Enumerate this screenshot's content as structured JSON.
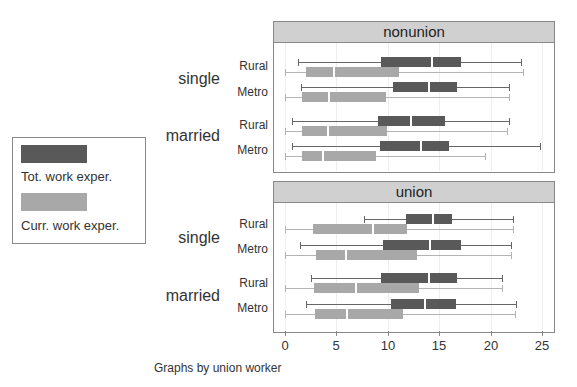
{
  "chart_data": {
    "type": "boxplot",
    "orientation": "horizontal",
    "title": "",
    "note": "Graphs by union worker",
    "xlabel": "",
    "xlim": [
      0,
      25
    ],
    "xticks": [
      0,
      5,
      10,
      15,
      20,
      25
    ],
    "grid": true,
    "legend": {
      "position": "left",
      "entries": [
        {
          "label": "Tot. work exper.",
          "color": "#595959"
        },
        {
          "label": "Curr. work exper.",
          "color": "#a8a8a8"
        }
      ]
    },
    "panels": [
      {
        "title": "nonunion",
        "groups": [
          {
            "label": "single",
            "rows": [
              {
                "label": "Rural",
                "tot": {
                  "min": 1.3,
                  "q1": 9.3,
                  "median": 14.3,
                  "q3": 17.1,
                  "max": 23.0
                },
                "curr": {
                  "min": 0.0,
                  "q1": 2.0,
                  "median": 4.8,
                  "q3": 11.1,
                  "max": 23.2
                }
              },
              {
                "label": "Metro",
                "tot": {
                  "min": 1.6,
                  "q1": 10.5,
                  "median": 14.0,
                  "q3": 16.7,
                  "max": 21.8
                },
                "curr": {
                  "min": 0.0,
                  "q1": 1.7,
                  "median": 4.3,
                  "q3": 9.8,
                  "max": 21.8
                }
              }
            ]
          },
          {
            "label": "married",
            "rows": [
              {
                "label": "Rural",
                "tot": {
                  "min": 0.7,
                  "q1": 9.0,
                  "median": 12.3,
                  "q3": 15.6,
                  "max": 21.8
                },
                "curr": {
                  "min": 0.0,
                  "q1": 1.7,
                  "median": 4.2,
                  "q3": 9.9,
                  "max": 21.6
                }
              },
              {
                "label": "Metro",
                "tot": {
                  "min": 0.7,
                  "q1": 9.2,
                  "median": 13.2,
                  "q3": 16.0,
                  "max": 24.8
                },
                "curr": {
                  "min": 0.0,
                  "q1": 1.7,
                  "median": 3.7,
                  "q3": 8.9,
                  "max": 19.5
                }
              }
            ]
          }
        ]
      },
      {
        "title": "union",
        "groups": [
          {
            "label": "single",
            "rows": [
              {
                "label": "Rural",
                "tot": {
                  "min": 7.7,
                  "q1": 11.8,
                  "median": 14.4,
                  "q3": 16.2,
                  "max": 22.2
                },
                "curr": {
                  "min": 0.0,
                  "q1": 2.7,
                  "median": 8.6,
                  "q3": 11.9,
                  "max": 22.2
                }
              },
              {
                "label": "Metro",
                "tot": {
                  "min": 1.5,
                  "q1": 9.5,
                  "median": 14.1,
                  "q3": 17.1,
                  "max": 22.0
                },
                "curr": {
                  "min": 0.0,
                  "q1": 3.0,
                  "median": 5.9,
                  "q3": 12.8,
                  "max": 22.0
                }
              }
            ]
          },
          {
            "label": "married",
            "rows": [
              {
                "label": "Rural",
                "tot": {
                  "min": 2.5,
                  "q1": 9.3,
                  "median": 14.0,
                  "q3": 16.7,
                  "max": 21.1
                },
                "curr": {
                  "min": 0.0,
                  "q1": 2.8,
                  "median": 6.9,
                  "q3": 13.0,
                  "max": 21.1
                }
              },
              {
                "label": "Metro",
                "tot": {
                  "min": 2.0,
                  "q1": 10.3,
                  "median": 13.6,
                  "q3": 16.6,
                  "max": 22.5
                },
                "curr": {
                  "min": 0.0,
                  "q1": 2.9,
                  "median": 6.0,
                  "q3": 11.5,
                  "max": 22.4
                }
              }
            ]
          }
        ]
      }
    ]
  },
  "labels": {
    "legend_tot": "Tot. work exper.",
    "legend_curr": "Curr. work exper.",
    "panel1_title": "nonunion",
    "panel2_title": "union",
    "note": "Graphs by union worker"
  }
}
